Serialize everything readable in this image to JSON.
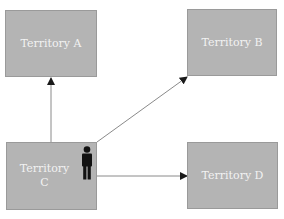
{
  "diagram": {
    "nodes": [
      {
        "id": "A",
        "label": "Territory A"
      },
      {
        "id": "B",
        "label": "Territory B"
      },
      {
        "id": "C",
        "label": "Territory\nC"
      },
      {
        "id": "D",
        "label": "Territory D"
      }
    ],
    "edges": [
      {
        "from": "C",
        "to": "A"
      },
      {
        "from": "C",
        "to": "B"
      },
      {
        "from": "C",
        "to": "D"
      }
    ],
    "icons": [
      {
        "name": "person-icon",
        "location": "Territory C"
      }
    ],
    "colors": {
      "box_fill": "#b4b4b4",
      "box_text": "#f2f2f2",
      "arrow": "#555555",
      "person": "#111111"
    }
  }
}
